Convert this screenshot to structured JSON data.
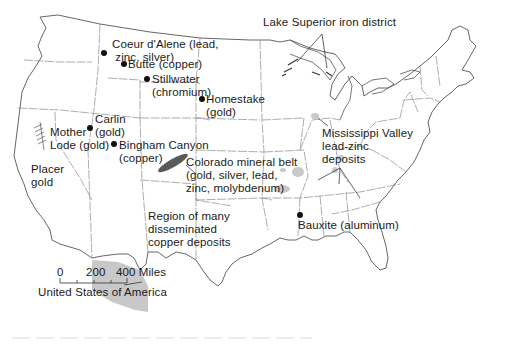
{
  "map": {
    "title": "United States of America",
    "colors": {
      "outline": "#555555",
      "state_border": "#777777",
      "deposit_fill": "#c8c8c8",
      "colorado_belt_fill": "#5a5a5a",
      "text": "#1a1a1a"
    },
    "scale_bar": {
      "ticks": [
        "0",
        "200",
        "400 Miles"
      ],
      "label": "United States of America"
    },
    "labels": {
      "lake_superior": "Lake Superior iron district",
      "coeur_dalene": "Coeur d'Alene (lead,\n zinc, silver)",
      "butte": "Butte (copper)",
      "stillwater": "Stillwater\n(chromium)",
      "homestake": "Homestake\n(gold)",
      "carlin": "Carlin\n(gold)",
      "mother_lode": "Mother\nLode (gold)",
      "placer_gold": "Placer\ngold",
      "bingham": "Bingham Canyon\n(copper)",
      "colorado_belt": "Colorado mineral belt\n(gold, silver, lead,\nzinc, molybdenum)",
      "mississippi_valley": "Mississippi Valley\nlead-zinc\ndeposits",
      "copper_region": "Region of many\ndisseminated\ncopper deposits",
      "bauxite": "Bauxite (aluminum)"
    }
  }
}
